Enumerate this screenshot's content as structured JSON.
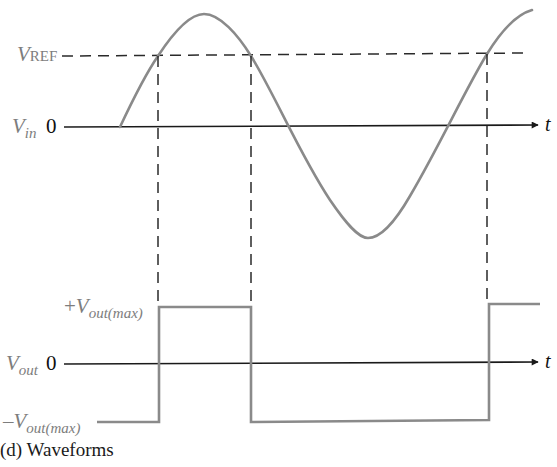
{
  "figure": {
    "caption": "(d) Waveforms",
    "colors": {
      "signal": "#8a8a8a",
      "axis": "#1a1a1a",
      "dashed": "#2a2a2a",
      "label_gray": "#7d7d7d"
    }
  },
  "input_plot": {
    "signal_label": {
      "main": "V",
      "sub": "in"
    },
    "zero_label": "0",
    "ref_label": {
      "main": "V",
      "sub": "REF"
    },
    "axis_label": "t",
    "waveform": "sine"
  },
  "output_plot": {
    "signal_label": {
      "main": "V",
      "sub": "out"
    },
    "zero_label": "0",
    "high_label": {
      "sign": "+",
      "main": "V",
      "sub": "out(max)"
    },
    "low_label": {
      "sign": "–",
      "main": "V",
      "sub": "out(max)"
    },
    "axis_label": "t",
    "waveform": "square"
  },
  "geometry": {
    "vin_zero_y": 127,
    "vref_y": 56,
    "vout_zero_y": 364,
    "vout_high_y": 307,
    "vout_low_y": 422,
    "crossings_x": [
      158,
      251,
      487
    ]
  }
}
